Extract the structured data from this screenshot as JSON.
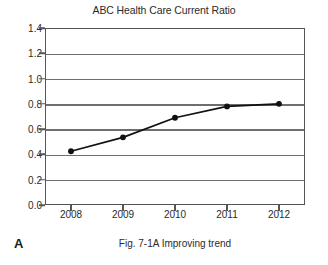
{
  "figure": {
    "panel_label": "A",
    "caption": "Fig. 7-1A Improving trend"
  },
  "chart_data": {
    "type": "line",
    "title": "ABC Health Care Current Ratio",
    "xlabel": "",
    "ylabel": "",
    "categories": [
      "2008",
      "2009",
      "2010",
      "2011",
      "2012"
    ],
    "values": [
      0.425,
      0.535,
      0.69,
      0.78,
      0.8
    ],
    "series": [
      {
        "name": "Current Ratio",
        "values": [
          0.425,
          0.535,
          0.69,
          0.78,
          0.8
        ]
      }
    ],
    "ylim": [
      0.0,
      1.4
    ],
    "ytick_labels": [
      "0.0",
      "0.2",
      "0.4",
      "0.6",
      "0.8",
      "1.0",
      "1.2",
      "1.4"
    ],
    "ytick_values": [
      0.0,
      0.2,
      0.4,
      0.6,
      0.8,
      1.0,
      1.2,
      1.4
    ],
    "xtick_labels": [
      "2008",
      "2009",
      "2010",
      "2011",
      "2012"
    ],
    "grid": "horizontal",
    "legend": "none",
    "marker": "filled-circle",
    "line_color": "#111111",
    "grid_color": "#6e6e6e",
    "axis_color": "#555555"
  }
}
